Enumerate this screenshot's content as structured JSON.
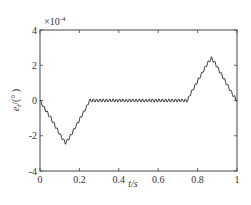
{
  "chart_data": {
    "type": "line",
    "title": "",
    "xlabel": "t/s",
    "ylabel": "e_t/(°)",
    "y_multiplier": "×10^-4",
    "xlim": [
      0,
      1
    ],
    "ylim": [
      -4,
      4
    ],
    "xticks": [
      0,
      0.2,
      0.4,
      0.6,
      0.8,
      1
    ],
    "yticks": [
      -4,
      -2,
      0,
      2,
      4
    ],
    "grid": false,
    "series": [
      {
        "name": "e_t",
        "x": [
          0,
          0.02,
          0.05,
          0.08,
          0.11,
          0.13,
          0.15,
          0.18,
          0.21,
          0.24,
          0.25,
          0.3,
          0.4,
          0.5,
          0.6,
          0.7,
          0.75,
          0.76,
          0.79,
          0.82,
          0.85,
          0.87,
          0.89,
          0.92,
          0.95,
          0.98,
          1.0
        ],
        "values": [
          0,
          -0.4,
          -0.9,
          -1.5,
          -2.1,
          -2.4,
          -2.1,
          -1.5,
          -0.9,
          -0.3,
          0,
          0,
          0,
          0,
          0,
          0,
          0,
          0.3,
          0.9,
          1.5,
          2.1,
          2.4,
          2.1,
          1.5,
          0.9,
          0.3,
          0
        ]
      }
    ]
  },
  "labels": {
    "multiplier_prefix": "×10",
    "multiplier_exp": "-4",
    "x_axis": "t/s",
    "y_axis_e": "e",
    "y_axis_sub": "t",
    "y_axis_rest": "/(°  )",
    "xtick_labels": [
      "0",
      "0.2",
      "0.4",
      "0.6",
      "0.8",
      "1"
    ],
    "ytick_labels": [
      "4",
      "2",
      "0",
      "-2",
      "-4"
    ]
  }
}
